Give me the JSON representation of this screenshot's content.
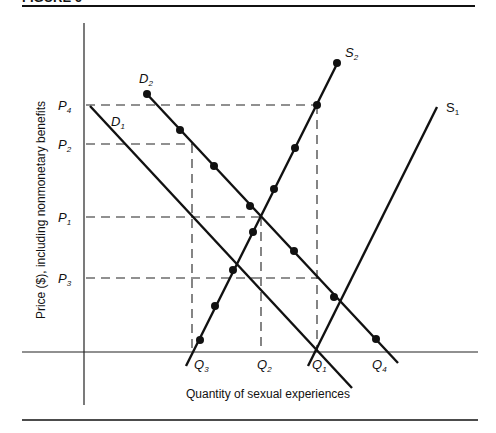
{
  "figure": {
    "caption_fragment": "FIGURE 6",
    "ylabel": "Price ($), including nonmonetary benefits",
    "xlabel": "Quantity of sexual experiences"
  },
  "price_labels": [
    {
      "main": "P",
      "sub": "4",
      "y": 105
    },
    {
      "main": "P",
      "sub": "2",
      "y": 144
    },
    {
      "main": "P",
      "sub": "1",
      "y": 217
    },
    {
      "main": "P",
      "sub": "3",
      "y": 278
    }
  ],
  "quantity_labels": [
    {
      "main": "Q",
      "sub": "3",
      "x": 192
    },
    {
      "main": "Q",
      "sub": "2",
      "x": 262
    },
    {
      "main": "Q",
      "sub": "1",
      "x": 318
    },
    {
      "main": "Q",
      "sub": "4",
      "x": 377
    }
  ],
  "curve_labels": {
    "D1": {
      "main": "D",
      "sub": "1"
    },
    "D2": {
      "main": "D",
      "sub": "2"
    },
    "S1": {
      "main": "S",
      "sub": "1"
    },
    "S2": {
      "main": "S",
      "sub": "2"
    }
  },
  "colors": {
    "ink": "#111111",
    "background": "#ffffff"
  }
}
